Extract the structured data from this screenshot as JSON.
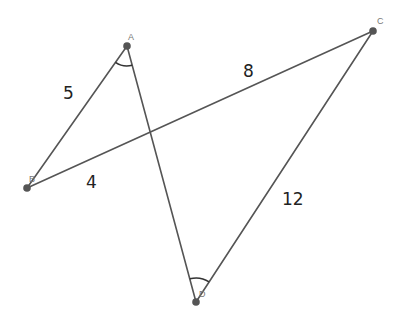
{
  "diagram": {
    "type": "geometry",
    "points": {
      "A": {
        "label": "A",
        "x": 127,
        "y": 46
      },
      "B": {
        "label": "B",
        "x": 27,
        "y": 188
      },
      "C": {
        "label": "C",
        "x": 373,
        "y": 31
      },
      "D": {
        "label": "D",
        "x": 196,
        "y": 302
      }
    },
    "segments": [
      {
        "from": "A",
        "to": "B"
      },
      {
        "from": "A",
        "to": "D"
      },
      {
        "from": "B",
        "to": "C"
      },
      {
        "from": "C",
        "to": "D"
      }
    ],
    "measurements": {
      "AB": "5",
      "BC_upper": "8",
      "BC_lower": "4",
      "CD": "12"
    },
    "angle_marks": [
      {
        "vertex": "A",
        "between": [
          "B",
          "D"
        ]
      },
      {
        "vertex": "D",
        "between": [
          "A",
          "C"
        ]
      }
    ],
    "colors": {
      "line": "#555555",
      "point": "#555555",
      "label": "#777777",
      "measurement": "#222222"
    }
  }
}
